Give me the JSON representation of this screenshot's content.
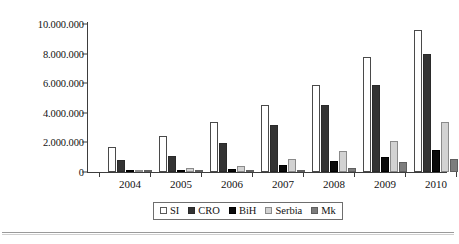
{
  "chart_data": {
    "type": "bar",
    "title": "",
    "xlabel": "",
    "ylabel": "",
    "categories": [
      "2004",
      "2005",
      "2006",
      "2007",
      "2008",
      "2009",
      "2010"
    ],
    "series": [
      {
        "name": "SI",
        "color": "#ffffff",
        "values": [
          1700000,
          2450000,
          3400000,
          4500000,
          5900000,
          7750000,
          9600000
        ]
      },
      {
        "name": "CRO",
        "color": "#333333",
        "values": [
          800000,
          1050000,
          1950000,
          3200000,
          4550000,
          5900000,
          8000000
        ]
      },
      {
        "name": "BiH",
        "color": "#0a0a0a",
        "values": [
          100000,
          120000,
          200000,
          500000,
          750000,
          1000000,
          1500000
        ]
      },
      {
        "name": "Serbia",
        "color": "#d2d2d2",
        "values": [
          80000,
          250000,
          400000,
          850000,
          1450000,
          2100000,
          3400000
        ]
      },
      {
        "name": "Mk",
        "color": "#7d7d7d",
        "values": [
          60000,
          100000,
          120000,
          150000,
          300000,
          650000,
          900000
        ]
      }
    ],
    "ylim": [
      0,
      10000000
    ],
    "ytick_labels": [
      "10.000.000",
      "8.000.000",
      "6.000.000",
      "4.000.000",
      "2.000.000",
      "0"
    ],
    "ytick_values": [
      10000000,
      8000000,
      6000000,
      4000000,
      2000000,
      0
    ],
    "grid": false,
    "legend_position": "bottom"
  },
  "legend": {
    "items": [
      {
        "label": "SI"
      },
      {
        "label": "CRO"
      },
      {
        "label": "BiH"
      },
      {
        "label": "Serbia"
      },
      {
        "label": "Mk"
      }
    ]
  }
}
